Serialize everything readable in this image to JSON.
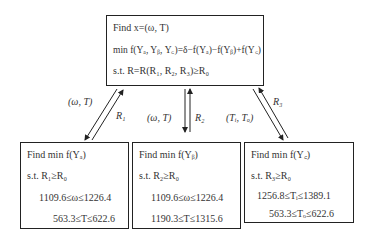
{
  "top_box": {
    "line1": "Find x=(ω, T)",
    "line2": "min f(Yₐ, Yᵦ, Y꜀)=δ−f(Yₐ)−f(Yᵦ)+f(Y꜀)",
    "line3": "s.t.  R=R(R₁, R₂, R₃)≥R₀"
  },
  "boxes": [
    {
      "title": "Find  min f(Yₐ)",
      "constraint": "s.t.     R₁≥R₀",
      "range1": "1109.6≤ω≤1226.4",
      "range2": "563.3≤T≤622.6"
    },
    {
      "title": "Find  min  f(Yᵦ)",
      "constraint": "s.t.    R₂≥R₀",
      "range1": "1109.6≤ω≤1226.4",
      "range2": "1190.3≤T≤1315.6"
    },
    {
      "title": "Find  min  f(Y꜀)",
      "constraint": "s.t.  R₃≥R₀",
      "range1": "1256.8≤Tᵢ≤1389.1",
      "range2": "563.3≤Tₒ≤622.6"
    }
  ],
  "edges": [
    {
      "down_label": "(ω, T)",
      "up_label": "R₁"
    },
    {
      "down_label": "(ω, T)",
      "up_label": "R₂"
    },
    {
      "down_label": "(Tᵢ, Tₒ)",
      "up_label": "R₃"
    }
  ]
}
